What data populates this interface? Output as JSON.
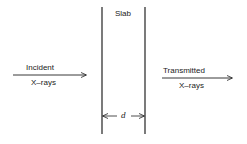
{
  "diagram": {
    "slab_label": "Slab",
    "thickness_label": "d",
    "incident": {
      "line1": "Incident",
      "line2": "X–rays"
    },
    "transmitted": {
      "line1": "Transmitted",
      "line2": "X–rays"
    },
    "colors": {
      "stroke": "#222222",
      "background": "#ffffff"
    }
  }
}
